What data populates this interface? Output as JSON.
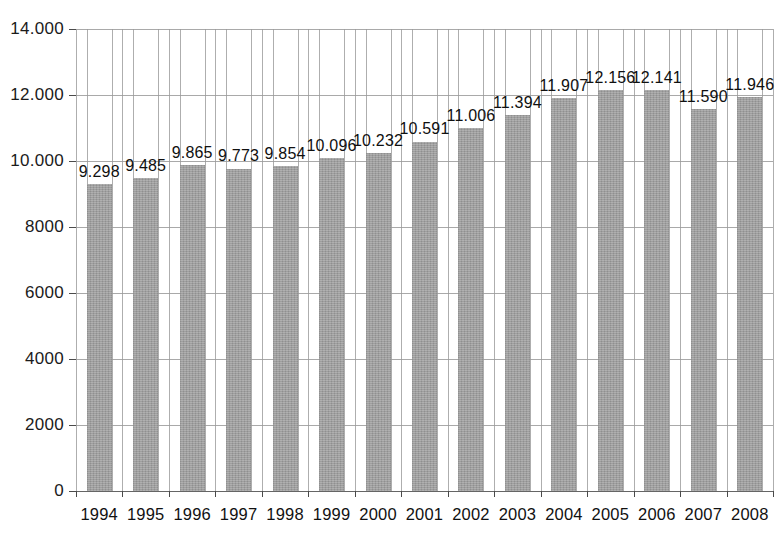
{
  "chart_data": {
    "type": "bar",
    "title": "",
    "subtitle": "",
    "xlabel": "",
    "ylabel": "",
    "categories": [
      "1994",
      "1995",
      "1996",
      "1997",
      "1998",
      "1999",
      "2000",
      "2001",
      "2002",
      "2003",
      "2004",
      "2005",
      "2006",
      "2007",
      "2008"
    ],
    "values": [
      9298,
      9485,
      9865,
      9773,
      9854,
      10096,
      10232,
      10591,
      11006,
      11394,
      11907,
      12156,
      12141,
      11590,
      11946
    ],
    "data_labels": [
      "9.298",
      "9.485",
      "9.865",
      "9.773",
      "9.854",
      "10.096",
      "10.232",
      "10.591",
      "11.006",
      "11.394",
      "11.907",
      "12.156",
      "12.141",
      "11.590",
      "11.946"
    ],
    "ylim": [
      0,
      14000
    ],
    "ytick_values": [
      0,
      2000,
      4000,
      6000,
      8000,
      10000,
      12000,
      14000
    ],
    "ytick_labels": [
      "0",
      "2000",
      "4000",
      "6000",
      "8000",
      "10.000",
      "12.000",
      "14.000"
    ],
    "grid": {
      "horizontal": true,
      "vertical": true
    },
    "legend": {
      "visible": false,
      "position": "none"
    },
    "bar_color": "#a0a0a0",
    "axis_color": "#4a4a4a",
    "grid_color": "#9a9a9a",
    "background_color": "#ffffff",
    "text_color": "#111111"
  }
}
